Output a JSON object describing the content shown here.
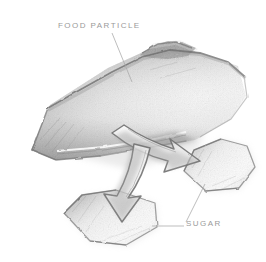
{
  "figure": {
    "medium": "pencil sketch",
    "background_color": "#ffffff",
    "ink_color": "#6f6f6f",
    "label_color": "#9a9a9a",
    "width": 266,
    "height": 262
  },
  "labels": {
    "food_particle": "FOOD PARTICLE",
    "sugar": "SUGAR"
  },
  "objects": [
    {
      "name": "food-particle",
      "shape": "large irregular angular blob",
      "label": "FOOD PARTICLE",
      "shading": "graphite, dark top ridge and lower-left edge, light center"
    },
    {
      "name": "sugar-crystal-right",
      "shape": "hexagon",
      "label": "SUGAR",
      "shading": "graphite, dark left and lower edges"
    },
    {
      "name": "sugar-crystal-lower",
      "shape": "hexagon",
      "label": "SUGAR",
      "shading": "graphite, dark left and lower edges"
    }
  ],
  "arrows": [
    {
      "name": "arrow-to-right-crystal",
      "from": "food-particle",
      "to": "sugar-crystal-right",
      "direction": "right-down",
      "style": "outlined 3d block arrow"
    },
    {
      "name": "arrow-to-lower-crystal",
      "from": "food-particle",
      "to": "sugar-crystal-lower",
      "direction": "down-left",
      "style": "outlined 3d block arrow"
    }
  ],
  "leader_lines": [
    {
      "name": "leader-food-particle",
      "from_label": "FOOD PARTICLE",
      "to_object": "food-particle"
    },
    {
      "name": "leader-sugar-right",
      "from_label": "SUGAR",
      "to_object": "sugar-crystal-right"
    },
    {
      "name": "leader-sugar-lower",
      "from_label": "SUGAR",
      "to_object": "sugar-crystal-lower"
    }
  ]
}
